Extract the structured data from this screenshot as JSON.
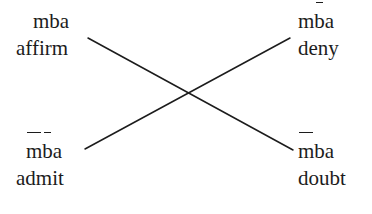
{
  "diagram": {
    "kind": "square-of-opposition",
    "width": 372,
    "height": 214,
    "background_color": "#ffffff",
    "line_color": "#1c1c1c",
    "text_color": "#1c1c1c"
  },
  "corners": {
    "top_left": {
      "position": "top-left",
      "term_letters": [
        {
          "char": "m",
          "macron": false
        },
        {
          "char": "b",
          "macron": false
        },
        {
          "char": "a",
          "macron": false
        }
      ],
      "term_plain": "mba",
      "verb": "affirm"
    },
    "top_right": {
      "position": "top-right",
      "term_letters": [
        {
          "char": "m",
          "macron": false
        },
        {
          "char": "b",
          "macron": true
        },
        {
          "char": "a",
          "macron": false
        }
      ],
      "term_plain": "mb̄a",
      "verb": "deny"
    },
    "bottom_left": {
      "position": "bottom-left",
      "term_letters": [
        {
          "char": "m",
          "macron": true
        },
        {
          "char": "b",
          "macron": true
        },
        {
          "char": "a",
          "macron": false
        }
      ],
      "term_plain": "m̄b̄a",
      "verb": "admit"
    },
    "bottom_right": {
      "position": "bottom-right",
      "term_letters": [
        {
          "char": "m",
          "macron": true
        },
        {
          "char": "b",
          "macron": false
        },
        {
          "char": "a",
          "macron": false
        }
      ],
      "term_plain": "m̄ba",
      "verb": "doubt"
    }
  },
  "connectors": [
    {
      "name": "affirm-to-doubt",
      "from": "top-left",
      "to": "bottom-right",
      "x1": 88,
      "y1": 38,
      "x2": 293,
      "y2": 150
    },
    {
      "name": "admit-to-deny",
      "from": "bottom-left",
      "to": "top-right",
      "x1": 85,
      "y1": 149,
      "x2": 290,
      "y2": 38
    }
  ],
  "intersection": {
    "x": 188,
    "y": 94
  }
}
